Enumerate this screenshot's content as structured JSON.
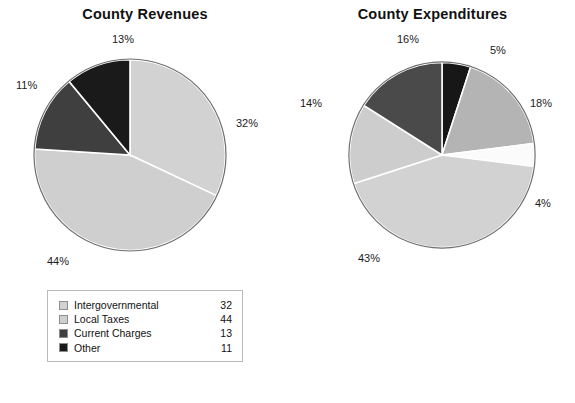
{
  "chart_data": [
    {
      "type": "pie",
      "title": "County Revenues",
      "id": "revenues",
      "categories": [
        "Intergovernmental",
        "Local Taxes",
        "Current Charges",
        "Other"
      ],
      "values": [
        32,
        44,
        13,
        11
      ],
      "percent_labels": [
        "32%",
        "44%",
        "13%",
        "11%"
      ],
      "colors": [
        "#d2d2d2",
        "#cfcfcf",
        "#3f3f3f",
        "#1a1a1a"
      ],
      "start_angle_deg": 0,
      "direction": "clockwise",
      "legend_position": "bottom"
    },
    {
      "type": "pie",
      "title": "County Expenditures",
      "id": "expenditures",
      "categories": [
        "Roads & Transportation",
        "Public Safety",
        "Parks, Housing, Environment",
        "Health & Welfare",
        "Interest",
        "General Government & Other"
      ],
      "values": [
        5,
        18,
        4,
        43,
        14,
        16
      ],
      "percent_labels": [
        "5%",
        "18%",
        "4%",
        "43%",
        "14%",
        "16%"
      ],
      "colors": [
        "#171717",
        "#b4b4b4",
        "#fbfbfb",
        "#d2d2d2",
        "#cdcdcd",
        "#4a4a4a"
      ],
      "start_angle_deg": 0,
      "direction": "clockwise",
      "legend_position": "bottom"
    }
  ],
  "revenues": {
    "title": "County Revenues",
    "labels": {
      "pct_intergovernmental": "32%",
      "pct_local_taxes": "44%",
      "pct_current_charges": "13%",
      "pct_other": "11%"
    },
    "legend": [
      {
        "label": "Intergovernmental",
        "value": "32",
        "color": "#d2d2d2"
      },
      {
        "label": "Local Taxes",
        "value": "44",
        "color": "#cfcfcf"
      },
      {
        "label": "Current Charges",
        "value": "13",
        "color": "#3f3f3f"
      },
      {
        "label": "Other",
        "value": "11",
        "color": "#1a1a1a"
      }
    ]
  },
  "expenditures": {
    "title": "County Expenditures",
    "labels": {
      "pct_roads": "5%",
      "pct_public_safety": "18%",
      "pct_parks": "4%",
      "pct_health": "43%",
      "pct_interest": "14%",
      "pct_general_government": "16%"
    },
    "legend": [
      {
        "label": "Roads & Transportation",
        "value": "5",
        "color": "#171717"
      },
      {
        "label": "Public Safety",
        "value": "18",
        "color": "#b4b4b4"
      },
      {
        "label": "Parks, Housing, Environment",
        "value": "4",
        "color": "#fbfbfb"
      },
      {
        "label": "Health & Welfare",
        "value": "43",
        "color": "#d2d2d2"
      },
      {
        "label": "Interest",
        "value": "14",
        "color": "#cdcdcd"
      },
      {
        "label": "General Government & Other",
        "value": "16",
        "color": "#4a4a4a"
      }
    ]
  }
}
